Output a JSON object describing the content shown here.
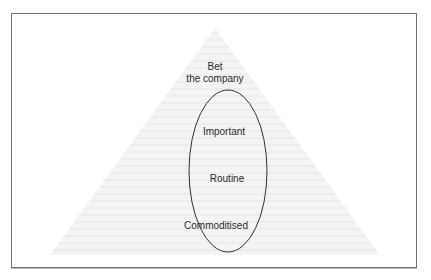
{
  "figure": {
    "type": "pyramid-with-ellipse",
    "frame": {
      "border_color": "#707070",
      "background": "#ffffff"
    },
    "pyramid": {
      "fill": "#f2f2f2",
      "stripe_color": "#e9e9e9",
      "apex": [
        215,
        28
      ],
      "base_left": [
        50,
        255
      ],
      "base_right": [
        380,
        255
      ]
    },
    "ellipse": {
      "cx": 228,
      "cy": 171,
      "rx": 39,
      "ry": 81,
      "stroke": "#333333"
    },
    "levels": [
      {
        "label_line1": "Bet",
        "label_line2": "the company"
      },
      {
        "label": "Important"
      },
      {
        "label": "Routine"
      },
      {
        "label": "Commoditised"
      }
    ]
  }
}
